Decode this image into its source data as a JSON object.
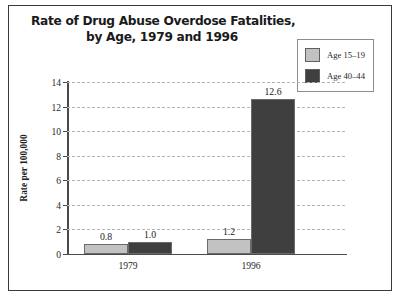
{
  "chart_data": {
    "type": "bar",
    "title": "Rate of Drug Abuse Overdose Fatalities, by Age, 1979 and 1996",
    "title_lines": [
      "Rate of Drug Abuse Overdose Fatalities,",
      "by Age, 1979 and 1996"
    ],
    "xlabel": "",
    "ylabel": "Rate per 100,000",
    "categories": [
      "1979",
      "1996"
    ],
    "series": [
      {
        "name": "Age 15–19",
        "values": [
          0.8,
          1.2
        ],
        "color": "#c2c2c2"
      },
      {
        "name": "Age 40–44",
        "values": [
          1.0,
          12.6
        ],
        "color": "#3f3f3f"
      }
    ],
    "value_labels": [
      [
        "0.8",
        "1.2"
      ],
      [
        "1.0",
        "12.6"
      ]
    ],
    "ylim": [
      0,
      14
    ],
    "yticks": [
      0,
      2,
      4,
      6,
      8,
      10,
      12,
      14
    ],
    "ytick_labels": [
      "0",
      "2",
      "4",
      "6",
      "8",
      "10",
      "12",
      "14"
    ],
    "grid": "horizontal-dashed",
    "legend_position": "top-right",
    "frame": true
  },
  "legend": {
    "entries": [
      {
        "label": "Age 15–19",
        "color": "#c2c2c2"
      },
      {
        "label": "Age 40–44",
        "color": "#3f3f3f"
      }
    ]
  }
}
